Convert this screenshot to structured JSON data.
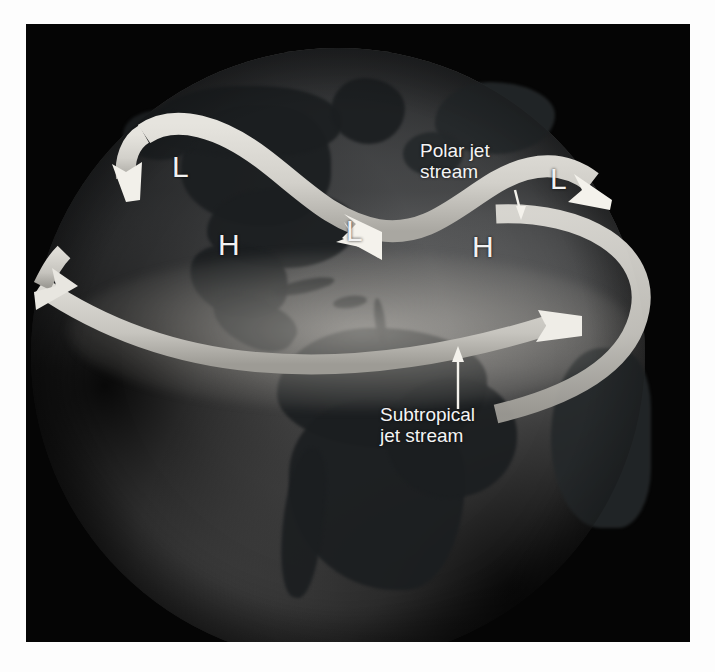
{
  "figure": {
    "background_color": "#ffffff",
    "plate_color": "#050505"
  },
  "annotations": {
    "polar_jet_label": "Polar jet\nstream",
    "subtropical_jet_label": "Subtropical\njet stream"
  },
  "pressure_markers": [
    {
      "symbol": "L",
      "name": "low-pressure-marker-northwest"
    },
    {
      "symbol": "H",
      "name": "high-pressure-marker-west"
    },
    {
      "symbol": "L",
      "name": "low-pressure-marker-center"
    },
    {
      "symbol": "H",
      "name": "high-pressure-marker-east"
    },
    {
      "symbol": "L",
      "name": "low-pressure-marker-northeast"
    }
  ],
  "colors": {
    "ribbon": "#d8d6d0",
    "ribbon_shadow": "#8e8c86",
    "label_text": "#f4f4f4",
    "globe_light": "#9a9a9a",
    "globe_dark": "#1b1e20"
  }
}
